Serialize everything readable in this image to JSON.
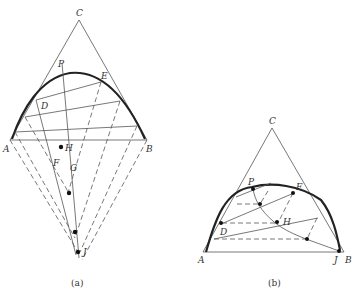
{
  "figure": {
    "panel_a": {
      "caption": "(a)",
      "vertex_labels": {
        "A": "A",
        "B": "B",
        "C": "C"
      },
      "point_labels": {
        "P": "P",
        "E": "E",
        "D": "D",
        "H": "H",
        "F": "F",
        "G": "G",
        "J": "J"
      }
    },
    "panel_b": {
      "caption": "(b)",
      "vertex_labels": {
        "A": "A",
        "B": "B",
        "C": "C"
      },
      "point_labels": {
        "P": "P",
        "E": "E",
        "D": "D",
        "H": "H",
        "J": "J"
      }
    }
  }
}
